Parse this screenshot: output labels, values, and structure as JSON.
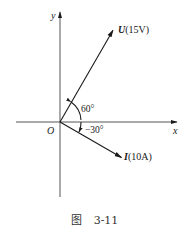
{
  "diagram": {
    "type": "phasor-diagram",
    "axes": {
      "x_label": "x",
      "y_label": "y",
      "origin_label": "O"
    },
    "phasors": [
      {
        "name": "U",
        "label_symbol": "U",
        "label_value": "(15V)",
        "magnitude": 15,
        "unit": "V",
        "angle_deg": 60
      },
      {
        "name": "I",
        "label_symbol": "I",
        "label_value": "(10A)",
        "magnitude": 10,
        "unit": "A",
        "angle_deg": -30
      }
    ],
    "angle_labels": {
      "u_angle": "60°",
      "i_angle": "−30°"
    },
    "colors": {
      "ink": "#1a1a1a"
    }
  },
  "caption": {
    "prefix": "图",
    "number": "3-11"
  }
}
